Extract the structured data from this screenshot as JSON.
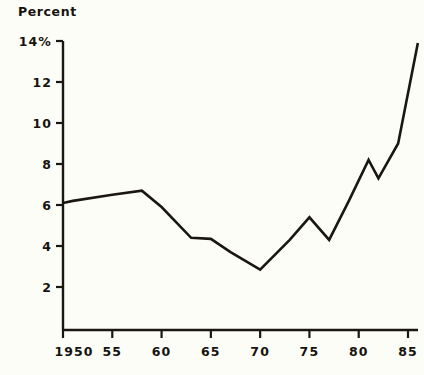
{
  "chart_data": {
    "type": "line",
    "title": "Percent",
    "xlabel": "",
    "ylabel": "Percent",
    "xlim": [
      1950,
      1986
    ],
    "ylim": [
      0,
      14
    ],
    "grid": false,
    "legend": "none",
    "y_ticks": [
      2,
      4,
      6,
      8,
      10,
      12,
      14
    ],
    "y_tick_labels": [
      "2",
      "4",
      "6",
      "8",
      "10",
      "12",
      "14%"
    ],
    "x_ticks": [
      1950,
      1955,
      1960,
      1965,
      1970,
      1975,
      1980,
      1985
    ],
    "x_tick_labels": [
      "1950",
      "55",
      "60",
      "65",
      "70",
      "75",
      "80",
      "85"
    ],
    "line_color": "#1a1713",
    "x": [
      1950,
      1951,
      1955,
      1958,
      1960,
      1963,
      1965,
      1967,
      1970,
      1973,
      1975,
      1977,
      1979,
      1981,
      1982,
      1984,
      1986
    ],
    "values": [
      6.1,
      6.2,
      6.5,
      6.7,
      5.9,
      4.4,
      4.35,
      3.7,
      2.85,
      4.3,
      5.4,
      4.3,
      6.2,
      8.2,
      7.3,
      9.0,
      13.9
    ],
    "series": [
      {
        "name": "Percent",
        "points": [
          {
            "x": 1950,
            "y": 6.1
          },
          {
            "x": 1951,
            "y": 6.2
          },
          {
            "x": 1955,
            "y": 6.5
          },
          {
            "x": 1958,
            "y": 6.7
          },
          {
            "x": 1960,
            "y": 5.9
          },
          {
            "x": 1963,
            "y": 4.4
          },
          {
            "x": 1965,
            "y": 4.35
          },
          {
            "x": 1967,
            "y": 3.7
          },
          {
            "x": 1970,
            "y": 2.85
          },
          {
            "x": 1973,
            "y": 4.3
          },
          {
            "x": 1975,
            "y": 5.4
          },
          {
            "x": 1977,
            "y": 4.3
          },
          {
            "x": 1979,
            "y": 6.2
          },
          {
            "x": 1981,
            "y": 8.2
          },
          {
            "x": 1982,
            "y": 7.3
          },
          {
            "x": 1984,
            "y": 9.0
          },
          {
            "x": 1986,
            "y": 13.9
          }
        ]
      }
    ]
  }
}
